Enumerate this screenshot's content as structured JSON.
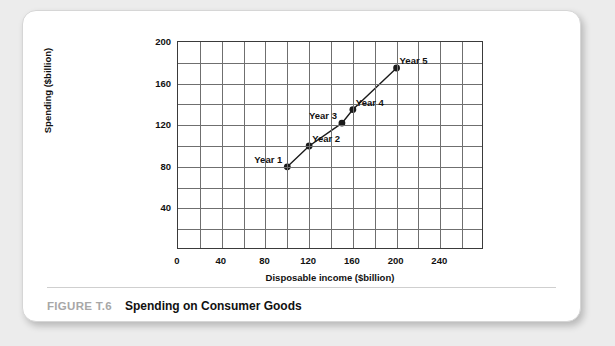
{
  "figure": {
    "number_label": "FIGURE T.6",
    "title": "Spending on Consumer Goods"
  },
  "chart_data": {
    "type": "line",
    "title": "Spending on Consumer Goods",
    "xlabel": "Disposable income ($billion)",
    "ylabel": "Spending ($billion)",
    "xlim": [
      0,
      280
    ],
    "ylim": [
      0,
      200
    ],
    "grid": true,
    "grid_step_x": 20,
    "grid_step_y": 20,
    "xticks": [
      0,
      40,
      80,
      120,
      160,
      200,
      240
    ],
    "xtick_labels": [
      "0",
      "40",
      "80",
      "120",
      "160",
      "200",
      "240"
    ],
    "yticks": [
      40,
      80,
      120,
      160,
      200
    ],
    "ytick_labels": [
      "40",
      "80",
      "120",
      "160",
      "200"
    ],
    "legend": "none",
    "series": [
      {
        "name": "Consumption function",
        "marker": "filled-circle",
        "color": "#1a1a1a",
        "points": [
          {
            "label": "Year 1",
            "x": 100,
            "y": 80,
            "label_side": "left"
          },
          {
            "label": "Year 2",
            "x": 120,
            "y": 100,
            "label_side": "right"
          },
          {
            "label": "Year 3",
            "x": 150,
            "y": 122,
            "label_side": "left"
          },
          {
            "label": "Year 4",
            "x": 160,
            "y": 135,
            "label_side": "right"
          },
          {
            "label": "Year 5",
            "x": 200,
            "y": 175,
            "label_side": "right"
          }
        ]
      }
    ]
  }
}
